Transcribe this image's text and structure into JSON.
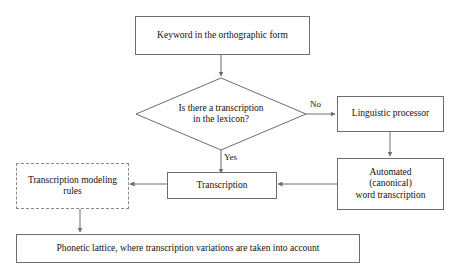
{
  "diagram": {
    "colors": {
      "stroke": "#6d6d6d",
      "dashed_stroke": "#8a8a8a",
      "text": "#111111",
      "background": "#ffffff"
    },
    "nodes": {
      "keyword": {
        "label": "Keyword in the orthographic form",
        "shape": "rectangle"
      },
      "decision": {
        "line1": "Is there a transcription",
        "line2": "in the lexicon?",
        "shape": "diamond"
      },
      "linguistic_processor": {
        "label": "Linguistic processor",
        "shape": "rectangle"
      },
      "automated_word_transcription": {
        "line1": "Automated",
        "line2": "(canonical)",
        "line3": "word transcription",
        "shape": "rectangle"
      },
      "transcription": {
        "label": "Transcription",
        "shape": "rectangle"
      },
      "transcription_modeling_rules": {
        "line1": "Transcription modeling",
        "line2": "rules",
        "shape": "rectangle-dashed"
      },
      "phonetic_lattice": {
        "label": "Phonetic lattice, where transcription variations are taken into account",
        "shape": "rectangle"
      }
    },
    "edge_labels": {
      "no": "No",
      "yes": "Yes"
    }
  }
}
